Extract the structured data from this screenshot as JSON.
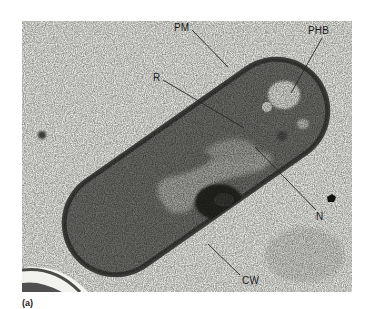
{
  "figure": {
    "type": "transmission electron micrograph",
    "caption": "(a)",
    "labels": [
      {
        "id": "PM",
        "text": "PM"
      },
      {
        "id": "PHB",
        "text": "PHB"
      },
      {
        "id": "R",
        "text": "R"
      },
      {
        "id": "N",
        "text": "N"
      },
      {
        "id": "CW",
        "text": "CW"
      }
    ],
    "colors": {
      "background": "#e6e6e2",
      "cell_wall": "#3a3a3a",
      "cytoplasm": "#6e6e6b",
      "nucleoid": "#a6a6a2",
      "phb_granule": "#d9d9d5",
      "dense_body": "#222222",
      "leader_line": "#2a2a2a"
    }
  }
}
